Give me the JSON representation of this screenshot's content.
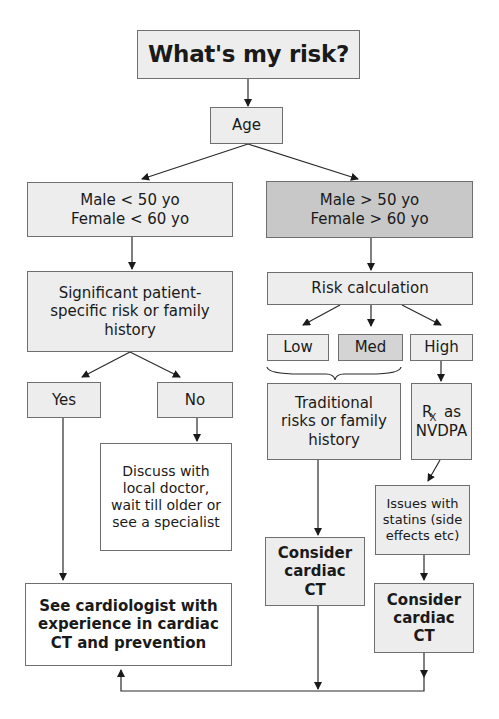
{
  "title": "What's my risk?",
  "nodes": {
    "age": "Age",
    "young": "Male < 50 yo\nFemale < 60 yo",
    "old": "Male > 50 yo\nFemale > 60 yo",
    "significant": "Significant patient-\nspecific risk or family\nhistory",
    "yes": "Yes",
    "no": "No",
    "discuss": "Discuss with\nlocal doctor,\nwait till older or\nsee a specialist",
    "see_cardiologist": "See cardiologist with\nexperience in cardiac\nCT and prevention",
    "risk_calc": "Risk calculation",
    "low": "Low",
    "med": "Med",
    "high": "High",
    "traditional": "Traditional\nrisks or family\nhistory",
    "rx_symbol": "R",
    "rx_sub": "X",
    "rx_rest_1": " as",
    "rx_rest_2": "NVDPA",
    "consider_ct_left": "Consider\ncardiac\nCT",
    "issues_statins": "Issues with\nstatins (side\neffects etc)",
    "consider_ct_right": "Consider\ncardiac\nCT"
  },
  "colors": {
    "light_fill": "#ededed",
    "dark_fill": "#c8c8c8",
    "border": "#6f6f6f",
    "line": "#2a2a2a"
  }
}
